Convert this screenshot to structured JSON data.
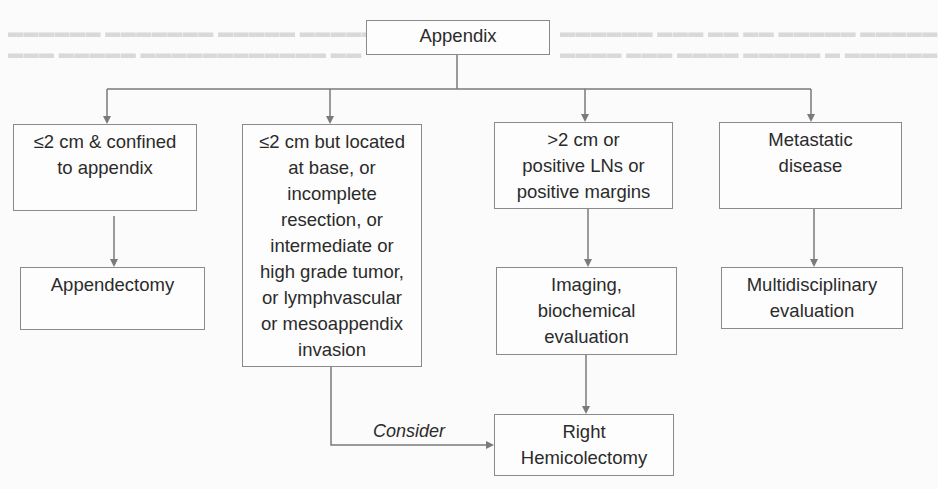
{
  "diagram": {
    "type": "flowchart",
    "root": {
      "id": "appendix",
      "lines": [
        "Appendix"
      ]
    },
    "branches": [
      {
        "id": "small-confined",
        "lines": [
          "≤2 cm & confined",
          "to appendix"
        ],
        "next": {
          "id": "appendectomy",
          "lines": [
            "Appendectomy"
          ]
        }
      },
      {
        "id": "small-high-risk",
        "lines": [
          "≤2 cm but located",
          "at base, or",
          "incomplete",
          "resection, or",
          "intermediate or",
          "high grade tumor,",
          "or lymphvascular",
          "or mesoappendix",
          "invasion"
        ],
        "edge_label": "Consider",
        "next_ref": "right-hemicolectomy"
      },
      {
        "id": "large-positive",
        "lines": [
          ">2 cm or",
          "positive LNs or",
          "positive margins"
        ],
        "next": {
          "id": "imaging-biochemical",
          "lines": [
            "Imaging,",
            "biochemical",
            "evaluation"
          ],
          "next": {
            "id": "right-hemicolectomy",
            "lines": [
              "Right",
              "Hemicolectomy"
            ]
          }
        }
      },
      {
        "id": "metastatic",
        "lines": [
          "Metastatic",
          "disease"
        ],
        "next": {
          "id": "multidisciplinary",
          "lines": [
            "Multidisciplinary",
            "evaluation"
          ]
        }
      }
    ],
    "edges": [
      {
        "from": "Appendix",
        "to": "≤2 cm & confined to appendix"
      },
      {
        "from": "Appendix",
        "to": "≤2 cm but located at base..."
      },
      {
        "from": "Appendix",
        "to": ">2 cm or positive LNs or positive margins"
      },
      {
        "from": "Appendix",
        "to": "Metastatic disease"
      },
      {
        "from": "≤2 cm & confined to appendix",
        "to": "Appendectomy"
      },
      {
        "from": ">2 cm or positive LNs or positive margins",
        "to": "Imaging, biochemical evaluation"
      },
      {
        "from": "Imaging, biochemical evaluation",
        "to": "Right Hemicolectomy"
      },
      {
        "from": "Metastatic disease",
        "to": "Multidisciplinary evaluation"
      },
      {
        "from": "≤2 cm but located at base...",
        "to": "Right Hemicolectomy",
        "label": "Consider"
      }
    ],
    "colors": {
      "line": "#7a7a7a",
      "box_border": "#8a8a8a",
      "text": "#2b2b2b",
      "background": "#fbfbfb"
    }
  }
}
